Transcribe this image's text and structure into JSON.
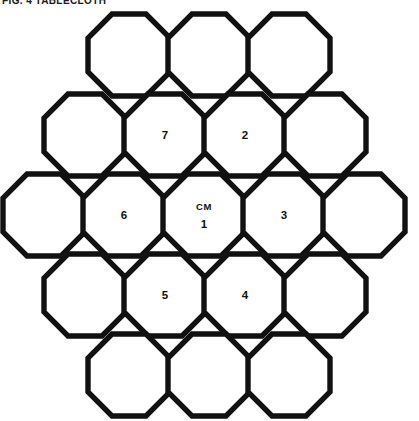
{
  "figure": {
    "caption": "FIG. 4  TABLECLOTH",
    "geometry": {
      "cell_width": 82,
      "cell_height": 82,
      "row_pitch": 80,
      "column_pitch": 80,
      "chamfer_ratio": 0.293,
      "stroke_color": "#111111",
      "fill_color": "#ffffff",
      "background_color": "#ffffff"
    },
    "rows": [
      {
        "index": 0,
        "count": 3,
        "y": 14,
        "x_start": 88,
        "cells": [
          {
            "id": "r0c0",
            "tag": "",
            "number": ""
          },
          {
            "id": "r0c1",
            "tag": "",
            "number": ""
          },
          {
            "id": "r0c2",
            "tag": "",
            "number": ""
          }
        ]
      },
      {
        "index": 1,
        "count": 4,
        "y": 94,
        "x_start": 44,
        "cells": [
          {
            "id": "r1c0",
            "tag": "",
            "number": ""
          },
          {
            "id": "r1c1",
            "tag": "",
            "number": "7"
          },
          {
            "id": "r1c2",
            "tag": "",
            "number": "2"
          },
          {
            "id": "r1c3",
            "tag": "",
            "number": ""
          }
        ]
      },
      {
        "index": 2,
        "count": 5,
        "y": 174,
        "x_start": 3,
        "cells": [
          {
            "id": "r2c0",
            "tag": "",
            "number": ""
          },
          {
            "id": "r2c1",
            "tag": "",
            "number": "6"
          },
          {
            "id": "r2c2",
            "tag": "CM",
            "number": "1"
          },
          {
            "id": "r2c3",
            "tag": "",
            "number": "3"
          },
          {
            "id": "r2c4",
            "tag": "",
            "number": ""
          }
        ]
      },
      {
        "index": 3,
        "count": 4,
        "y": 254,
        "x_start": 44,
        "cells": [
          {
            "id": "r3c0",
            "tag": "",
            "number": ""
          },
          {
            "id": "r3c1",
            "tag": "",
            "number": "5"
          },
          {
            "id": "r3c2",
            "tag": "",
            "number": "4"
          },
          {
            "id": "r3c3",
            "tag": "",
            "number": ""
          }
        ]
      },
      {
        "index": 4,
        "count": 3,
        "y": 334,
        "x_start": 88,
        "cells": [
          {
            "id": "r4c0",
            "tag": "",
            "number": ""
          },
          {
            "id": "r4c1",
            "tag": "",
            "number": ""
          },
          {
            "id": "r4c2",
            "tag": "",
            "number": ""
          }
        ]
      }
    ]
  }
}
